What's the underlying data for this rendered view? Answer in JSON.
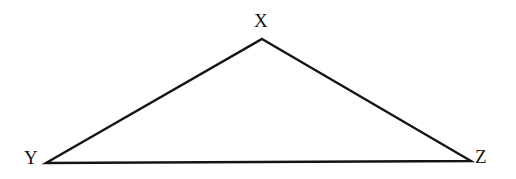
{
  "figure": {
    "kind": "geometry-diagram",
    "shape": "triangle",
    "background_color": "#ffffff",
    "stroke_color": "#141414",
    "stroke_width": 2.4,
    "width": 516,
    "height": 179
  },
  "labels": {
    "apex": "X",
    "bottom_left": "Y",
    "bottom_right": "Z"
  },
  "chart_data": {
    "type": "scatter",
    "title": "",
    "xlabel": "",
    "ylabel": "",
    "grid": false,
    "legend": "none",
    "xlim": [
      0,
      516
    ],
    "ylim": [
      179,
      0
    ],
    "vertices": [
      {
        "name": "X",
        "x": 262,
        "y": 39
      },
      {
        "name": "Y",
        "x": 46,
        "y": 163
      },
      {
        "name": "Z",
        "x": 471,
        "y": 161
      }
    ],
    "edges": [
      {
        "from": "Y",
        "to": "X"
      },
      {
        "from": "X",
        "to": "Z"
      },
      {
        "from": "Y",
        "to": "Z"
      }
    ],
    "label_offsets": [
      {
        "name": "X",
        "x": 254,
        "y": 11
      },
      {
        "name": "Y",
        "x": 24,
        "y": 148
      },
      {
        "name": "Z",
        "x": 475,
        "y": 147
      }
    ]
  }
}
